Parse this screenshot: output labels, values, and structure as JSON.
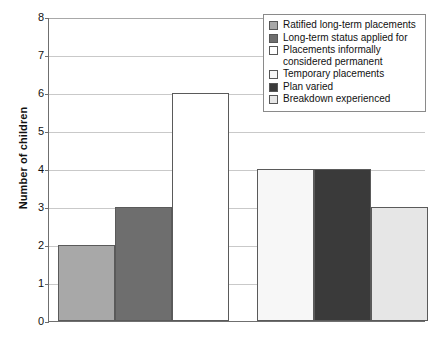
{
  "chart_data": {
    "type": "bar",
    "title": "",
    "xlabel": "",
    "ylabel": "Number of children",
    "ylim": [
      0,
      8
    ],
    "ytick_labels": [
      "0",
      "1",
      "2",
      "3",
      "4",
      "5",
      "6",
      "7",
      "8"
    ],
    "ytick_values": [
      0,
      1,
      2,
      3,
      4,
      5,
      6,
      7,
      8
    ],
    "grid": "horizontal",
    "legend_position": "top-right",
    "categories": [
      "Ratified long-term placements",
      "Long-term status applied for",
      "Placements informally considered permanent",
      "Temporary placements",
      "Plan varied",
      "Breakdown experienced"
    ],
    "values": [
      2,
      3,
      6,
      4,
      4,
      3
    ],
    "bar_colors": [
      "#a8a8a8",
      "#6e6e6e",
      "#ffffff",
      "#f7f7f7",
      "#3a3a3a",
      "#e6e6e6"
    ]
  },
  "axes": {
    "y_title": "Number of children",
    "y_ticks": [
      {
        "label": "8",
        "value": 8
      },
      {
        "label": "7",
        "value": 7
      },
      {
        "label": "6",
        "value": 6
      },
      {
        "label": "5",
        "value": 5
      },
      {
        "label": "4",
        "value": 4
      },
      {
        "label": "3",
        "value": 3
      },
      {
        "label": "2",
        "value": 2
      },
      {
        "label": "1",
        "value": 1
      },
      {
        "label": "0",
        "value": 0
      }
    ]
  },
  "legend": {
    "items": [
      {
        "label": "Ratified long-term placements",
        "color": "#a8a8a8"
      },
      {
        "label": "Long-term status applied for",
        "color": "#6e6e6e"
      },
      {
        "label": "Placements informally\nconsidered permanent",
        "color": "#ffffff"
      },
      {
        "label": "Temporary placements",
        "color": "#f7f7f7"
      },
      {
        "label": "Plan varied",
        "color": "#3a3a3a"
      },
      {
        "label": "Breakdown experienced",
        "color": "#e6e6e6"
      }
    ]
  },
  "colors": {
    "axis": "#6f6f6f",
    "grid": "#c9c9c9",
    "text": "#111111",
    "background": "#ffffff"
  }
}
